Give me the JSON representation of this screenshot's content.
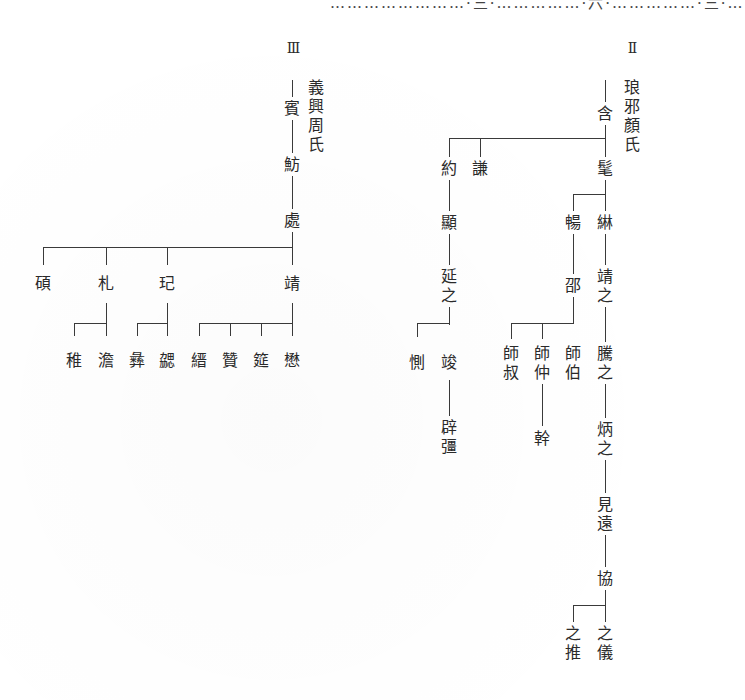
{
  "page_header": "……………………·三·……………·六·……………·三·…",
  "clans": [
    {
      "id": "III",
      "roman": "Ⅲ",
      "name": "義興周氏",
      "members": {
        "bin": "賓",
        "fang": "魴",
        "chu": "處",
        "shuo": "碩",
        "zha": "札",
        "qi": "玘",
        "jing": "靖",
        "zhi": "稚",
        "tan": "澹",
        "yi": "彝",
        "xie": "勰",
        "jin": "縉",
        "zan": "贊",
        "yan": "筵",
        "mao": "懋"
      }
    },
    {
      "id": "II",
      "roman": "Ⅱ",
      "name": "琅邪顏氏",
      "members": {
        "han": "含",
        "mao": "髦",
        "yue": "約",
        "qian": "謙",
        "chang": "暢",
        "chen": "綝",
        "xian": "顯",
        "shao": "邵",
        "jingzhi": "靖之",
        "yanzhi": "延之",
        "ce": "惻",
        "jun": "竣",
        "shishu": "師叔",
        "shizhong": "師仲",
        "shibo": "師伯",
        "tengzhi": "騰之",
        "bijiang": "辟彊",
        "gan": "幹",
        "bingzhi": "炳之",
        "jianyuan": "見遠",
        "xie": "協",
        "tuizhi": "之推",
        "yizhi": "之儀"
      }
    }
  ]
}
